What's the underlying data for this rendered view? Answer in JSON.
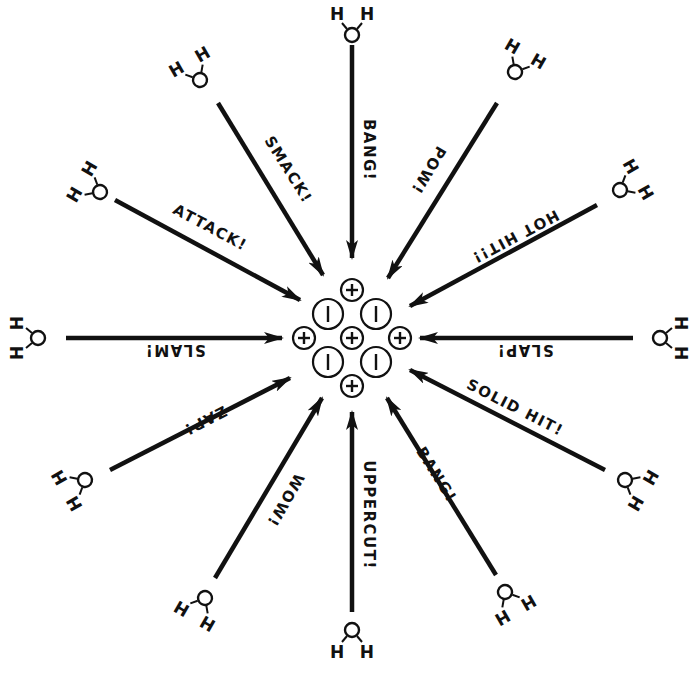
{
  "diagram": {
    "type": "hydration-of-ionic-crystal",
    "colors": {
      "ink": "#111111",
      "background": "#ffffff"
    },
    "center": [
      352,
      338
    ],
    "ions": [
      {
        "charge": "+",
        "x": 352,
        "y": 290,
        "r": 11
      },
      {
        "charge": "-",
        "x": 328,
        "y": 314,
        "r": 15
      },
      {
        "charge": "-",
        "x": 376,
        "y": 314,
        "r": 15
      },
      {
        "charge": "+",
        "x": 304,
        "y": 338,
        "r": 11
      },
      {
        "charge": "+",
        "x": 352,
        "y": 338,
        "r": 11
      },
      {
        "charge": "+",
        "x": 400,
        "y": 338,
        "r": 11
      },
      {
        "charge": "-",
        "x": 328,
        "y": 362,
        "r": 15
      },
      {
        "charge": "-",
        "x": 376,
        "y": 362,
        "r": 15
      },
      {
        "charge": "+",
        "x": 352,
        "y": 386,
        "r": 11
      }
    ],
    "attacks": [
      {
        "label": "BANG!",
        "x1": 352,
        "y1": 45,
        "x2": 352,
        "y2": 258,
        "lx": 368,
        "ly": 150,
        "rot": 90,
        "water": {
          "x": 352,
          "y": 35,
          "rot": 0
        }
      },
      {
        "label": "SMACK!",
        "x1": 218,
        "y1": 103,
        "x2": 323,
        "y2": 275,
        "lx": 288,
        "ly": 170,
        "rot": 58,
        "water": {
          "x": 200,
          "y": 80,
          "rot": -30
        }
      },
      {
        "label": "POW!",
        "x1": 497,
        "y1": 103,
        "x2": 388,
        "y2": 278,
        "lx": 428,
        "ly": 170,
        "rot": 121,
        "water": {
          "x": 515,
          "y": 72,
          "rot": 30
        }
      },
      {
        "label": "ATTACK!",
        "x1": 115,
        "y1": 200,
        "x2": 300,
        "y2": 300,
        "lx": 210,
        "ly": 228,
        "rot": 28,
        "water": {
          "x": 100,
          "y": 192,
          "rot": -60
        }
      },
      {
        "label": "HOT HIT!!",
        "x1": 597,
        "y1": 205,
        "x2": 410,
        "y2": 306,
        "lx": 515,
        "ly": 236,
        "rot": 152,
        "water": {
          "x": 620,
          "y": 190,
          "rot": 60
        }
      },
      {
        "label": "SLAM!",
        "x1": 66,
        "y1": 338,
        "x2": 282,
        "y2": 338,
        "lx": 175,
        "ly": 349,
        "rot": 180,
        "water": {
          "x": 38,
          "y": 338,
          "rot": -90
        }
      },
      {
        "label": "SLAP!",
        "x1": 633,
        "y1": 338,
        "x2": 420,
        "y2": 338,
        "lx": 525,
        "ly": 349,
        "rot": 180,
        "water": {
          "x": 660,
          "y": 338,
          "rot": 90
        }
      },
      {
        "label": "ZAP!",
        "x1": 110,
        "y1": 470,
        "x2": 290,
        "y2": 378,
        "lx": 205,
        "ly": 420,
        "rot": 153,
        "water": {
          "x": 85,
          "y": 480,
          "rot": -120
        }
      },
      {
        "label": "SOLID HIT!",
        "x1": 605,
        "y1": 470,
        "x2": 410,
        "y2": 370,
        "lx": 515,
        "ly": 408,
        "rot": 27,
        "water": {
          "x": 625,
          "y": 480,
          "rot": 120
        }
      },
      {
        "label": "WOW!",
        "x1": 215,
        "y1": 578,
        "x2": 322,
        "y2": 398,
        "lx": 285,
        "ly": 500,
        "rot": 120,
        "water": {
          "x": 205,
          "y": 598,
          "rot": -150
        }
      },
      {
        "label": "BANG!",
        "x1": 496,
        "y1": 575,
        "x2": 387,
        "y2": 398,
        "lx": 436,
        "ly": 475,
        "rot": 58,
        "water": {
          "x": 505,
          "y": 592,
          "rot": 150
        }
      },
      {
        "label": "UPPERCUT!",
        "x1": 352,
        "y1": 612,
        "x2": 352,
        "y2": 412,
        "lx": 368,
        "ly": 515,
        "rot": 90,
        "water": {
          "x": 352,
          "y": 630,
          "rot": 180
        }
      }
    ],
    "water_atoms": {
      "oxygen": "O",
      "hydrogen": "H"
    }
  }
}
